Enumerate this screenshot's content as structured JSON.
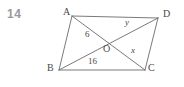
{
  "question": {
    "number": "14"
  },
  "figure": {
    "type": "parallelogram-with-diagonals",
    "stroke_color": "#6b6b6b",
    "background_color": "#ffffff",
    "vertices": [
      {
        "name": "A",
        "label": "A",
        "x": 72,
        "y": 16,
        "label_x": 63,
        "label_y": 8
      },
      {
        "name": "D",
        "label": "D",
        "x": 158,
        "y": 18,
        "label_x": 163,
        "label_y": 10
      },
      {
        "name": "B",
        "label": "B",
        "x": 59,
        "y": 70,
        "label_x": 48,
        "label_y": 64
      },
      {
        "name": "C",
        "label": "C",
        "x": 145,
        "y": 70,
        "label_x": 148,
        "label_y": 64
      },
      {
        "name": "O",
        "label": "O",
        "x": 108,
        "y": 43,
        "label_x": 104,
        "label_y": 45
      }
    ],
    "edges": [
      {
        "name": "side-AD",
        "from": "A",
        "to": "D"
      },
      {
        "name": "side-DC",
        "from": "D",
        "to": "C"
      },
      {
        "name": "side-CB",
        "from": "C",
        "to": "B"
      },
      {
        "name": "side-BA",
        "from": "B",
        "to": "A"
      },
      {
        "name": "diagonal-AC",
        "from": "A",
        "to": "C"
      },
      {
        "name": "diagonal-BD",
        "from": "B",
        "to": "D"
      }
    ],
    "segment_labels": [
      {
        "name": "segment-label-6",
        "text": "6",
        "italic": false,
        "x": 85,
        "y": 31
      },
      {
        "name": "segment-label-16",
        "text": "16",
        "italic": false,
        "x": 89,
        "y": 58
      },
      {
        "name": "segment-label-y",
        "text": "y",
        "italic": true,
        "x": 125,
        "y": 19
      },
      {
        "name": "segment-label-x",
        "text": "x",
        "italic": true,
        "x": 131,
        "y": 47
      }
    ]
  }
}
